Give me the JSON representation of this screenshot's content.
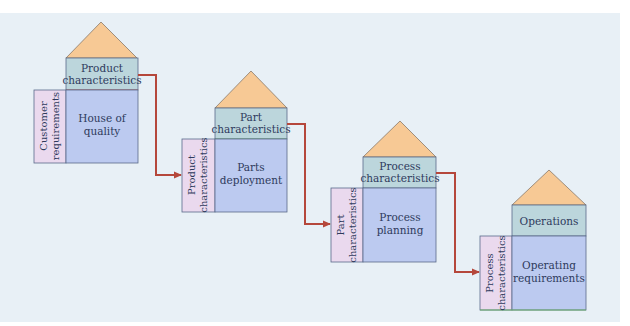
{
  "diagram": {
    "type": "House of Quality cascade (QFD)",
    "colors": {
      "background": "#e8f0f6",
      "roof": "#f7c995",
      "top_section": "#bcd6dc",
      "main_section": "#bccaf0",
      "side_section": "#ead9ee",
      "border": "#5a6a8a",
      "arrow": "#b5473b",
      "text": "#2e3a5c"
    },
    "houses": [
      {
        "top_line1": "Product",
        "top_line2": "characteristics",
        "main_line1": "House of",
        "main_line2": "quality",
        "side_line1": "Customer",
        "side_line2": "requirements"
      },
      {
        "top_line1": "Part",
        "top_line2": "characteristics",
        "main_line1": "Parts",
        "main_line2": "deployment",
        "side_line1": "Product",
        "side_line2": "characteristics"
      },
      {
        "top_line1": "Process",
        "top_line2": "characteristics",
        "main_line1": "Process",
        "main_line2": "planning",
        "side_line1": "Part",
        "side_line2": "characteristics"
      },
      {
        "top_line1": "Operations",
        "top_line2": "",
        "main_line1": "Operating",
        "main_line2": "requirements",
        "side_line1": "Process",
        "side_line2": "characteristics"
      }
    ],
    "arrows": [
      {
        "from": "Product characteristics",
        "to": "Product characteristics"
      },
      {
        "from": "Part characteristics",
        "to": "Part characteristics"
      },
      {
        "from": "Process characteristics",
        "to": "Process characteristics"
      }
    ]
  }
}
